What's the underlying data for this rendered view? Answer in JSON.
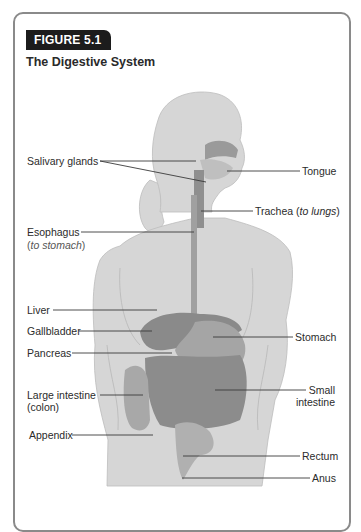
{
  "figure": {
    "badge": "FIGURE 5.1",
    "title": "The Digestive System"
  },
  "labels": {
    "salivary_glands": "Salivary glands",
    "tongue": "Tongue",
    "trachea": "Trachea (",
    "trachea_italic": "to lungs",
    "trachea_end": ")",
    "esophagus": "Esophagus",
    "esophagus_sub_open": "(",
    "esophagus_sub_italic": "to stomach",
    "esophagus_sub_close": ")",
    "liver": "Liver",
    "gallbladder": "Gallbladder",
    "pancreas": "Pancreas",
    "stomach": "Stomach",
    "large_intestine": "Large intestine",
    "large_intestine_sub": "(colon)",
    "small_intestine_1": "Small",
    "small_intestine_2": "intestine",
    "appendix": "Appendix",
    "rectum": "Rectum",
    "anus": "Anus"
  },
  "colors": {
    "frame": "#8a8a8a",
    "badge_bg": "#1c1c1c",
    "silhouette": "#d6d6d6",
    "organ": "#8f8f8f",
    "leader_line": "#3a3a3a"
  }
}
